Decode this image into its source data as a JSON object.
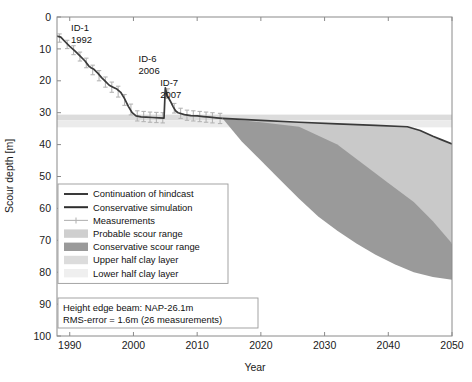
{
  "chart_data": {
    "type": "area",
    "title": "",
    "xlabel": "Year",
    "ylabel": "Scour depth [m]",
    "xlim": [
      1988,
      2050
    ],
    "ylim": [
      0,
      100
    ],
    "y_inverted": true,
    "grid": false,
    "xticks": [
      1990,
      2000,
      2010,
      2020,
      2030,
      2040,
      2050
    ],
    "xtick_labels": [
      "1990",
      "2000",
      "2010",
      "2020",
      "2030",
      "2040",
      "2050"
    ],
    "yticks": [
      0,
      10,
      20,
      30,
      40,
      50,
      60,
      70,
      80,
      90,
      100
    ],
    "ytick_labels": [
      "0",
      "10",
      "20",
      "30",
      "40",
      "50",
      "60",
      "70",
      "80",
      "90",
      "100"
    ],
    "legend_position": "lower-left-inside",
    "series": [
      {
        "name": "Conservative simulation",
        "type": "line",
        "color": "#3a3a3a",
        "points": [
          [
            1988.0,
            6.0
          ],
          [
            1988.6,
            6.3
          ],
          [
            1989.2,
            7.6
          ],
          [
            1990.0,
            9.2
          ],
          [
            1990.8,
            10.6
          ],
          [
            1991.6,
            12.2
          ],
          [
            1992.4,
            13.8
          ],
          [
            1993.0,
            15.4
          ],
          [
            1993.4,
            16.0
          ],
          [
            1993.8,
            16.4
          ],
          [
            1994.4,
            17.6
          ],
          [
            1995.0,
            19.0
          ],
          [
            1995.6,
            20.2
          ],
          [
            1996.2,
            21.4
          ],
          [
            1996.8,
            22.0
          ],
          [
            1997.4,
            22.6
          ],
          [
            1998.0,
            23.6
          ],
          [
            1998.6,
            25.6
          ],
          [
            1999.2,
            28.0
          ],
          [
            1999.8,
            30.0
          ],
          [
            2000.4,
            31.0
          ],
          [
            2001.2,
            31.3
          ],
          [
            2002.0,
            31.4
          ],
          [
            2003.0,
            31.5
          ],
          [
            2004.0,
            31.6
          ],
          [
            2004.8,
            31.7
          ],
          [
            2005.0,
            22.2
          ],
          [
            2005.3,
            24.6
          ],
          [
            2005.8,
            26.4
          ],
          [
            2006.2,
            28.0
          ],
          [
            2006.6,
            29.4
          ],
          [
            2007.0,
            30.0
          ],
          [
            2008.0,
            30.6
          ],
          [
            2009.0,
            30.9
          ],
          [
            2010.0,
            31.0
          ],
          [
            2011.0,
            31.2
          ],
          [
            2012.0,
            31.4
          ],
          [
            2013.0,
            31.6
          ],
          [
            2014.0,
            31.8
          ]
        ]
      },
      {
        "name": "Continuation of hindcast",
        "type": "line",
        "color": "#3a3a3a",
        "points": [
          [
            2014.0,
            31.8
          ],
          [
            2020.0,
            32.4
          ],
          [
            2026.0,
            33.0
          ],
          [
            2032.0,
            33.5
          ],
          [
            2038.0,
            34.0
          ],
          [
            2043.0,
            34.4
          ],
          [
            2045.0,
            35.6
          ],
          [
            2047.0,
            37.4
          ],
          [
            2048.5,
            38.6
          ],
          [
            2050.0,
            39.8
          ]
        ]
      },
      {
        "name": "Probable scour range",
        "type": "band",
        "color": "#c9c9c9",
        "upper": [
          [
            2014.0,
            31.8
          ],
          [
            2020.0,
            32.4
          ],
          [
            2026.0,
            33.0
          ],
          [
            2032.0,
            33.5
          ],
          [
            2038.0,
            34.0
          ],
          [
            2043.0,
            34.4
          ],
          [
            2045.0,
            35.6
          ],
          [
            2047.0,
            37.4
          ],
          [
            2050.0,
            39.8
          ]
        ],
        "lower": [
          [
            2014.0,
            31.8
          ],
          [
            2018.0,
            38.0
          ],
          [
            2022.0,
            42.0
          ],
          [
            2026.0,
            46.0
          ],
          [
            2030.0,
            50.0
          ],
          [
            2034.0,
            54.0
          ],
          [
            2038.0,
            58.0
          ],
          [
            2042.0,
            62.0
          ],
          [
            2046.0,
            66.5
          ],
          [
            2050.0,
            71.0
          ]
        ]
      },
      {
        "name": "Conservative scour range",
        "type": "band",
        "color": "#9a9a9a",
        "upper": [
          [
            2014.0,
            31.8
          ],
          [
            2020.0,
            33.0
          ],
          [
            2026.0,
            34.4
          ],
          [
            2032.0,
            40.0
          ],
          [
            2036.0,
            46.0
          ],
          [
            2040.0,
            52.0
          ],
          [
            2044.0,
            58.0
          ],
          [
            2047.0,
            64.0
          ],
          [
            2050.0,
            71.0
          ]
        ],
        "lower": [
          [
            2014.0,
            31.8
          ],
          [
            2017.0,
            39.0
          ],
          [
            2020.0,
            45.0
          ],
          [
            2023.0,
            51.0
          ],
          [
            2026.0,
            57.0
          ],
          [
            2029.0,
            62.5
          ],
          [
            2032.0,
            67.0
          ],
          [
            2035.0,
            71.0
          ],
          [
            2038.0,
            74.5
          ],
          [
            2041.0,
            77.5
          ],
          [
            2044.0,
            80.0
          ],
          [
            2047.0,
            81.5
          ],
          [
            2050.0,
            82.4
          ]
        ]
      },
      {
        "name": "Upper half clay layer",
        "type": "hband",
        "color": "#dcdcdc",
        "y_top": 30.6,
        "y_bottom": 32.4
      },
      {
        "name": "Lower half clay layer",
        "type": "hband",
        "color": "#ebebeb",
        "y_top": 32.4,
        "y_bottom": 34.6
      },
      {
        "name": "Measurements",
        "type": "errorbar",
        "color": "#b5b5b5",
        "points": [
          [
            1988.4,
            6.6,
            2.6
          ],
          [
            1989.6,
            8.6,
            2.6
          ],
          [
            1990.6,
            10.4,
            2.8
          ],
          [
            1991.6,
            12.4,
            2.8
          ],
          [
            1992.6,
            14.4,
            3.0
          ],
          [
            1993.6,
            16.6,
            3.0
          ],
          [
            1994.6,
            18.4,
            3.2
          ],
          [
            1995.6,
            20.4,
            3.2
          ],
          [
            1996.6,
            22.0,
            3.2
          ],
          [
            1997.6,
            23.4,
            3.4
          ],
          [
            1998.6,
            26.0,
            3.4
          ],
          [
            1999.6,
            29.0,
            3.4
          ],
          [
            2000.6,
            31.0,
            3.2
          ],
          [
            2001.6,
            31.2,
            3.2
          ],
          [
            2002.6,
            31.4,
            3.2
          ],
          [
            2003.6,
            31.5,
            3.2
          ],
          [
            2004.6,
            31.6,
            3.2
          ],
          [
            2005.4,
            24.0,
            3.0
          ],
          [
            2006.4,
            28.6,
            3.0
          ],
          [
            2007.4,
            30.2,
            3.2
          ],
          [
            2008.4,
            30.8,
            3.2
          ],
          [
            2009.4,
            31.0,
            3.2
          ],
          [
            2010.4,
            31.2,
            3.2
          ],
          [
            2011.4,
            31.4,
            3.2
          ],
          [
            2012.4,
            31.6,
            3.2
          ],
          [
            2013.6,
            31.8,
            3.2
          ]
        ]
      }
    ],
    "annotations": [
      {
        "id": "ID-1",
        "year_label": "1992",
        "x": 1990.2,
        "y": 4.5
      },
      {
        "id": "ID-6",
        "year_label": "2006",
        "x": 2000.8,
        "y": 14.0
      },
      {
        "id": "ID-7",
        "year_label": "2007",
        "x": 2004.2,
        "y": 21.5
      }
    ]
  },
  "legend": {
    "items": [
      {
        "label": "Continuation of hindcast",
        "kind": "line",
        "color": "#3a3a3a"
      },
      {
        "label": "Conservative simulation",
        "kind": "line",
        "color": "#2e2e2e"
      },
      {
        "label": "Measurements",
        "kind": "errorbar",
        "color": "#b5b5b5"
      },
      {
        "label": "Probable scour range",
        "kind": "patch",
        "color": "#cfcfcf"
      },
      {
        "label": "Conservative scour range",
        "kind": "patch",
        "color": "#9a9a9a"
      },
      {
        "label": "Upper half clay layer",
        "kind": "patch",
        "color": "#dcdcdc"
      },
      {
        "label": "Lower half clay layer",
        "kind": "patch",
        "color": "#efefef"
      }
    ]
  },
  "info_box": {
    "line1": "Height edge beam: NAP-26.1m",
    "line2": "RMS-error = 1.6m (26 measurements)"
  },
  "annotation_text": {
    "id1": "ID-1",
    "id1_year": "1992",
    "id6": "ID-6",
    "id6_year": "2006",
    "id7": "ID-7",
    "id7_year": "2007"
  },
  "axes": {
    "x_title": "Year",
    "y_title": "Scour depth [m]"
  },
  "colors": {
    "axis": "#8a8a8a",
    "line_dark": "#3a3a3a",
    "probable": "#cfcfcf",
    "conservative": "#9a9a9a",
    "clay_upper": "#dcdcdc",
    "clay_lower": "#efefef",
    "measure": "#b5b5b5"
  }
}
